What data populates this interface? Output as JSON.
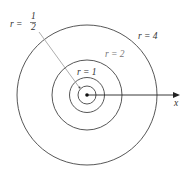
{
  "diagram": {
    "type": "concentric-circles",
    "center": "origin",
    "circles": [
      {
        "r": "1/2",
        "label": "r = 1/2"
      },
      {
        "r": "1",
        "label": "r = 1"
      },
      {
        "r": "2",
        "label": "r = 2"
      },
      {
        "r": "4",
        "label": "r = 4"
      }
    ],
    "labels": {
      "r_half_prefix": "r =",
      "r_half_num": "1",
      "r_half_den": "2",
      "r1": "r = 1",
      "r2": "r = 2",
      "r4": "r = 4",
      "x_axis": "x"
    },
    "colors": {
      "stroke": "#333333",
      "muted": "#777777"
    }
  }
}
